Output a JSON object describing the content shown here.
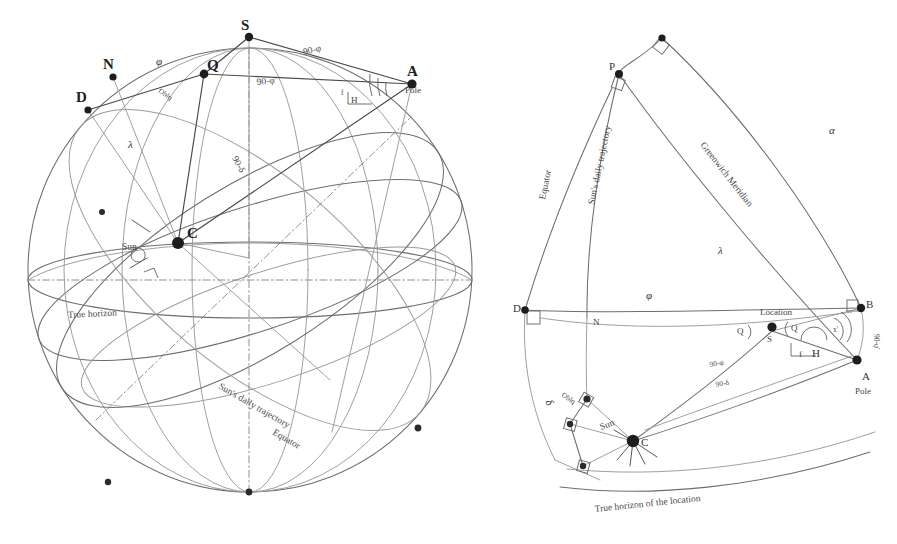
{
  "figure": {
    "background_color": "#ffffff",
    "ink_color": "#555555",
    "width": 897,
    "height": 544
  },
  "left_diagram": {
    "name": "celestial-sphere",
    "points": [
      {
        "id": "S",
        "label": "S",
        "x": 249,
        "y": 37,
        "kind": "zenith"
      },
      {
        "id": "N",
        "label": "N",
        "x": 113,
        "y": 77,
        "kind": "node"
      },
      {
        "id": "D",
        "label": "D",
        "x": 88,
        "y": 110,
        "kind": "node"
      },
      {
        "id": "Q",
        "label": "Q",
        "x": 204,
        "y": 74,
        "kind": "node"
      },
      {
        "id": "A",
        "label": "A",
        "x": 412,
        "y": 84,
        "kind": "pole"
      },
      {
        "id": "C",
        "label": "C",
        "x": 178,
        "y": 243,
        "kind": "center"
      },
      {
        "id": "Sun",
        "label": "Sun",
        "x": 140,
        "y": 247,
        "kind": "sun"
      }
    ],
    "point_sublabels": [
      {
        "for": "A",
        "text": "Pole"
      }
    ],
    "angle_labels": [
      {
        "text": "90-φ",
        "x": 318,
        "y": 51
      },
      {
        "text": "90-φ'",
        "x": 273,
        "y": 80
      },
      {
        "text": "90-δ",
        "x": 241,
        "y": 152
      },
      {
        "text": "φ",
        "x": 160,
        "y": 62
      },
      {
        "text": "λ",
        "x": 132,
        "y": 143
      },
      {
        "text": "H",
        "x": 355,
        "y": 98
      },
      {
        "text": "f",
        "x": 343,
        "y": 91
      },
      {
        "text": "Oblq",
        "x": 171,
        "y": 88
      }
    ],
    "curve_labels": [
      {
        "text": "True horizon",
        "x": 68,
        "y": 315,
        "rotate": -3
      },
      {
        "text": "Sun's daily trajectory",
        "x": 230,
        "y": 395,
        "rotate": 30
      },
      {
        "text": "Equator",
        "x": 278,
        "y": 440,
        "rotate": 30
      }
    ]
  },
  "right_diagram": {
    "name": "spherical-triangle",
    "points": [
      {
        "id": "P",
        "label": "P",
        "x": 619,
        "y": 74,
        "kind": "node"
      },
      {
        "id": "apex",
        "label": "",
        "x": 662,
        "y": 38,
        "kind": "node"
      },
      {
        "id": "D",
        "label": "D",
        "x": 525,
        "y": 310,
        "kind": "node"
      },
      {
        "id": "N",
        "label": "N",
        "x": 597,
        "y": 318,
        "kind": "node"
      },
      {
        "id": "B",
        "label": "B",
        "x": 861,
        "y": 308,
        "kind": "node"
      },
      {
        "id": "S",
        "label": "S",
        "x": 772,
        "y": 327,
        "kind": "location"
      },
      {
        "id": "A",
        "label": "A",
        "x": 857,
        "y": 360,
        "kind": "pole"
      },
      {
        "id": "C",
        "label": "C",
        "x": 633,
        "y": 441,
        "kind": "sun"
      },
      {
        "id": "Obliq",
        "label": "",
        "x": 587,
        "y": 399,
        "kind": "node"
      },
      {
        "id": "corner1",
        "label": "",
        "x": 570,
        "y": 424,
        "kind": "node"
      },
      {
        "id": "corner2",
        "label": "",
        "x": 583,
        "y": 466,
        "kind": "node"
      }
    ],
    "point_sublabels": [
      {
        "for": "A",
        "text": "Pole"
      },
      {
        "for": "S",
        "text": "Location"
      }
    ],
    "angle_labels": [
      {
        "text": "α",
        "x": 833,
        "y": 130
      },
      {
        "text": "λ",
        "x": 722,
        "y": 250
      },
      {
        "text": "φ",
        "x": 650,
        "y": 295
      },
      {
        "text": "Q",
        "x": 741,
        "y": 330
      },
      {
        "text": "Q",
        "x": 795,
        "y": 327
      },
      {
        "text": "90-φ",
        "x": 722,
        "y": 363
      },
      {
        "text": "90-δ",
        "x": 728,
        "y": 383
      },
      {
        "text": "90-φ'",
        "x": 876,
        "y": 330
      },
      {
        "text": "f",
        "x": 803,
        "y": 353
      },
      {
        "text": "H",
        "x": 818,
        "y": 350
      },
      {
        "text": "x'",
        "x": 838,
        "y": 329
      },
      {
        "text": "Oblq",
        "x": 573,
        "y": 392
      },
      {
        "text": "δ",
        "x": 549,
        "y": 398
      }
    ],
    "curve_labels": [
      {
        "text": "Greenwich Meridian",
        "x": 700,
        "y": 145,
        "rotate": 52
      },
      {
        "text": "Sun's daily trajectory",
        "x": 594,
        "y": 205,
        "rotate": -78
      },
      {
        "text": "Equator",
        "x": 545,
        "y": 200,
        "rotate": -78
      },
      {
        "text": "Sun",
        "x": 607,
        "y": 428,
        "rotate": -20
      },
      {
        "text": "True horizon of the location",
        "x": 630,
        "y": 505,
        "rotate": -5
      }
    ]
  },
  "icons": {
    "point_marker": "filled-dot-icon",
    "right_angle": "right-angle-marker-icon",
    "angle_arc": "angle-arc-icon"
  }
}
